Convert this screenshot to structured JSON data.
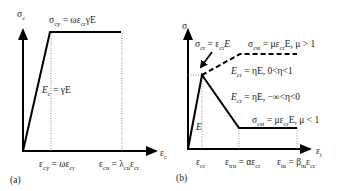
{
  "panel_a": {
    "caption": "(a)",
    "y_axis": {
      "sym": "σ",
      "sub": "c"
    },
    "x_axis": {
      "sym": "ε",
      "sub": "c"
    },
    "plateau_label": {
      "lhs_sym": "σ",
      "lhs_sub": "cy",
      "eq": " = ωε",
      "eq_sub": "cr",
      "tail": "γE"
    },
    "modulus_label": {
      "sym": "E",
      "sub": "c",
      "eq": " = γE"
    },
    "tick_1": {
      "lhs_sym": "ε",
      "lhs_sub": "cy",
      "eq": " = ωε",
      "eq_sub": "cr"
    },
    "tick_2": {
      "lhs_sym": "ε",
      "lhs_sub": "cu",
      "eq": " = λ",
      "eq_sub": "cu",
      "tail": "ε",
      "tail_sub": "cr"
    }
  },
  "panel_b": {
    "caption": "(b)",
    "y_axis": {
      "sym": "σ",
      "sub": "t"
    },
    "x_axis": {
      "sym": "ε",
      "sub": "t"
    },
    "peak_label": {
      "lhs_sym": "σ",
      "lhs_sub": "cr",
      "eq": " = ε",
      "eq_sub": "cr",
      "tail": "E"
    },
    "hardening_stress": {
      "lhs_sym": "σ",
      "lhs_sub": "cst",
      "eq": " = με",
      "eq_sub": "cr",
      "tail": "E, μ > 1"
    },
    "hardening_modulus": {
      "sym": "E",
      "sub": "cr",
      "eq": " = ηE, 0<η<1"
    },
    "softening_modulus": {
      "sym": "E",
      "sub": "cr",
      "eq": " = ηE, −∞<η<0"
    },
    "softening_stress": {
      "lhs_sym": "σ",
      "lhs_sub": "cst",
      "eq": " = με",
      "eq_sub": "cr",
      "tail": "E, μ < 1"
    },
    "elastic_label": "E",
    "tick_1": {
      "sym": "ε",
      "sub": "cr"
    },
    "tick_2": {
      "lhs_sym": "ε",
      "lhs_sub": "trn",
      "eq": " = αε",
      "eq_sub": "cr"
    },
    "tick_3": {
      "lhs_sym": "ε",
      "lhs_sub": "tu",
      "eq": " = β",
      "eq_sub": "tu",
      "tail": "ε",
      "tail_sub": "cr"
    }
  }
}
